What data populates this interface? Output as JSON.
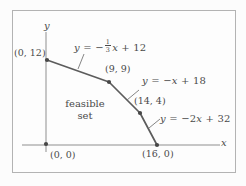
{
  "figure": {
    "axis": {
      "x_label": "x",
      "y_label": "y"
    },
    "point_labels": {
      "p0_12": "(0, 12)",
      "p9_9": "(9, 9)",
      "p14_4": "(14, 4)",
      "p16_0": "(16, 0)",
      "p0_0": "(0, 0)"
    },
    "region_label": {
      "line1": "feasible",
      "line2": "set"
    },
    "equations": [
      {
        "name": "edge-1",
        "runs": [
          [
            "it",
            "y"
          ],
          [
            "up",
            " = −"
          ],
          [
            "frac",
            "1",
            "3"
          ],
          [
            "it",
            "x"
          ],
          [
            "up",
            " + 12"
          ]
        ]
      },
      {
        "name": "edge-2",
        "runs": [
          [
            "it",
            "y"
          ],
          [
            "up",
            " = −"
          ],
          [
            "it",
            "x"
          ],
          [
            "up",
            " + 18"
          ]
        ]
      },
      {
        "name": "edge-3",
        "runs": [
          [
            "it",
            "y"
          ],
          [
            "up",
            " = −2"
          ],
          [
            "it",
            "x"
          ],
          [
            "up",
            " + 32"
          ]
        ]
      }
    ]
  },
  "chart_data": {
    "type": "line",
    "xlabel": "x",
    "ylabel": "y",
    "region_label": "feasible set",
    "vertices": [
      [
        0,
        12
      ],
      [
        9,
        9
      ],
      [
        14,
        4
      ],
      [
        16,
        0
      ],
      [
        0,
        0
      ]
    ],
    "boundary_lines": [
      "y = -1/3x + 12",
      "y = -x + 18",
      "y = -2x + 32"
    ]
  },
  "geometry": {
    "axes": [
      [
        22,
        145,
        220,
        145
      ],
      [
        46,
        32,
        46,
        152
      ]
    ],
    "boundary": [
      [
        47,
        60
      ],
      [
        109,
        82
      ],
      [
        140,
        113
      ],
      [
        157,
        145
      ]
    ],
    "leaders": [
      [
        84,
        54,
        78,
        69
      ],
      [
        139,
        90,
        127,
        100
      ],
      [
        160,
        119,
        149,
        128
      ]
    ],
    "dots": [
      [
        47,
        60
      ],
      [
        109,
        82
      ],
      [
        140,
        113
      ],
      [
        157,
        145
      ],
      [
        46,
        144
      ]
    ]
  }
}
